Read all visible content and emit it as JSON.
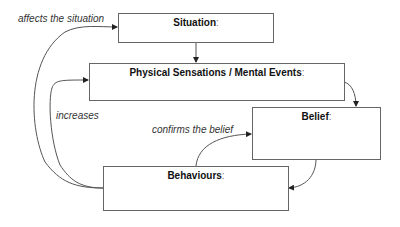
{
  "diagram": {
    "nodes": [
      {
        "id": "situation",
        "label": "Situation",
        "suffix": ":"
      },
      {
        "id": "physical",
        "label": "Physical Sensations / Mental Events",
        "suffix": ":"
      },
      {
        "id": "belief",
        "label": "Belief",
        "suffix": ":"
      },
      {
        "id": "behaviours",
        "label": "Behaviours",
        "suffix": ":"
      }
    ],
    "edges": [
      {
        "from": "situation",
        "to": "physical",
        "label": ""
      },
      {
        "from": "physical",
        "to": "belief",
        "label": ""
      },
      {
        "from": "belief",
        "to": "behaviours",
        "label": ""
      },
      {
        "from": "behaviours",
        "to": "situation",
        "label": "affects the situation"
      },
      {
        "from": "behaviours",
        "to": "physical",
        "label": "increases"
      },
      {
        "from": "behaviours",
        "to": "belief",
        "label": "confirms the belief"
      }
    ]
  },
  "colors": {
    "stroke": "#555555",
    "text": "#111111",
    "label": "#333333"
  }
}
